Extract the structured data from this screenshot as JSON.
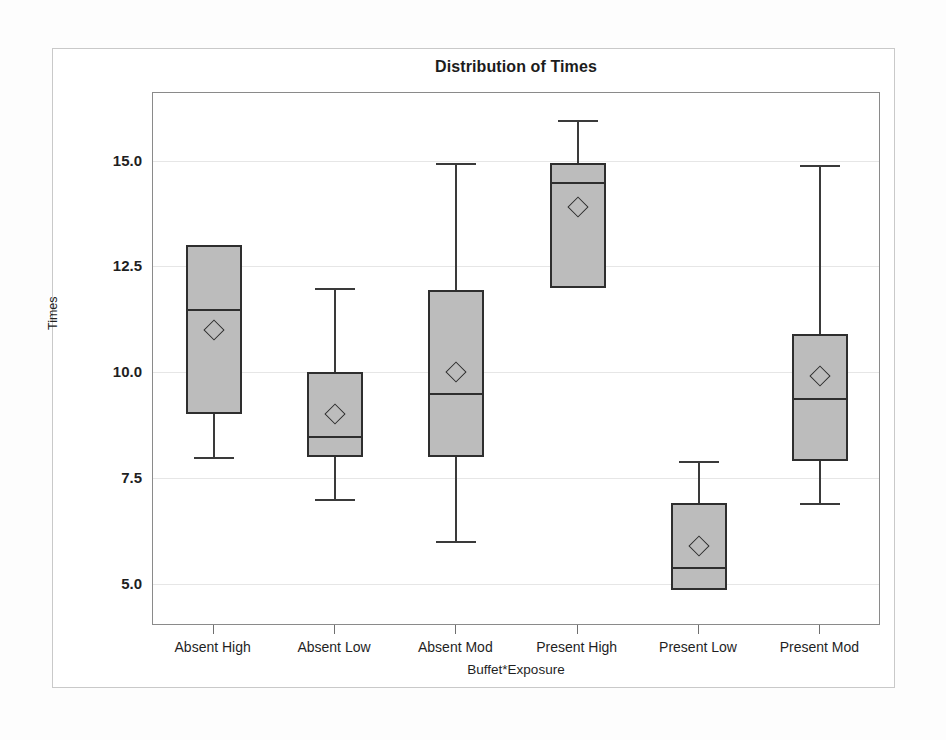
{
  "chart_data": {
    "type": "box",
    "title": "Distribution of Times",
    "xlabel": "Buffet*Exposure",
    "ylabel": "Times",
    "ylim": [
      4.0,
      16.6
    ],
    "grid": true,
    "legend": "none",
    "yticks": [
      "5.0",
      "7.5",
      "10.0",
      "12.5",
      "15.0"
    ],
    "ytick_values": [
      5.0,
      7.5,
      10.0,
      12.5,
      15.0
    ],
    "categories": [
      "Absent High",
      "Absent Low",
      "Absent Mod",
      "Present High",
      "Present Low",
      "Present Mod"
    ],
    "boxes": [
      {
        "category": "Absent High",
        "whisker_low": 8.0,
        "q1": 9.0,
        "median": 11.5,
        "mean": 11.0,
        "q3": 13.0,
        "whisker_high": 13.0
      },
      {
        "category": "Absent Low",
        "whisker_low": 7.0,
        "q1": 8.0,
        "median": 8.5,
        "mean": 9.0,
        "q3": 10.0,
        "whisker_high": 12.0
      },
      {
        "category": "Absent Mod",
        "whisker_low": 6.0,
        "q1": 8.0,
        "median": 9.5,
        "mean": 10.0,
        "q3": 11.95,
        "whisker_high": 14.95
      },
      {
        "category": "Present High",
        "whisker_low": 12.0,
        "q1": 12.0,
        "median": 14.5,
        "mean": 13.9,
        "q3": 14.95,
        "whisker_high": 15.95
      },
      {
        "category": "Present Low",
        "whisker_low": 4.85,
        "q1": 4.85,
        "median": 5.4,
        "mean": 5.9,
        "q3": 6.9,
        "whisker_high": 7.9
      },
      {
        "category": "Present Mod",
        "whisker_low": 6.9,
        "q1": 7.9,
        "median": 9.4,
        "mean": 9.9,
        "q3": 10.9,
        "whisker_high": 14.9
      }
    ],
    "colors": {
      "box_fill": "#bcbcbc",
      "box_stroke": "#2e2e2e",
      "gridline": "#e6e6e6",
      "axis": "#8a8a8a",
      "text": "#1f1f1f"
    }
  }
}
